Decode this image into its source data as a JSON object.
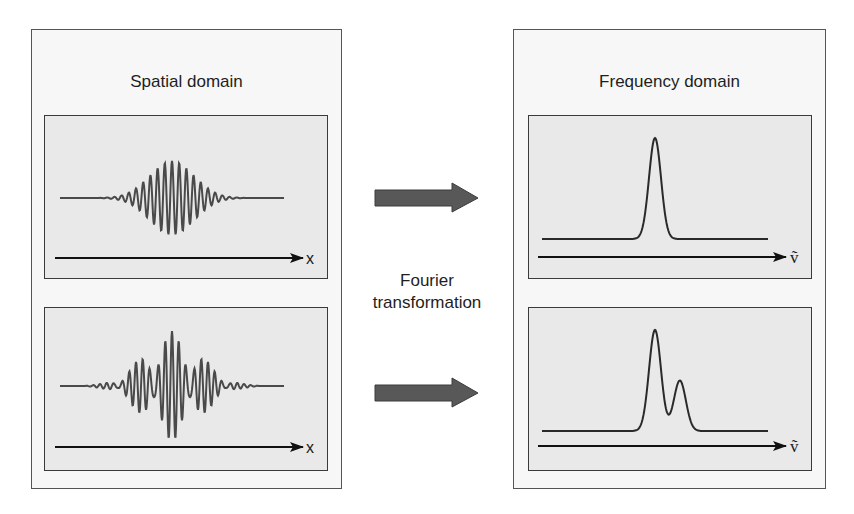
{
  "colors": {
    "panel_border": "#555555",
    "panel_bg": "#f7f7f7",
    "plot_bg": "#e9e9e9",
    "plot_border": "#3a3a3a",
    "waveform": "#4a4a4a",
    "spectrum": "#2a2a2a",
    "axis": "#111111",
    "arrow_fill": "#585858",
    "arrow_stroke": "#3c3c3c"
  },
  "left_panel": {
    "title": "Spatial domain",
    "plots": [
      {
        "name": "single-frequency-interferogram",
        "axis_label": "x",
        "description": "Gaussian-enveloped cosine burst (single frequency)"
      },
      {
        "name": "two-frequency-interferogram",
        "axis_label": "x",
        "description": "Beat pattern from two frequency components"
      }
    ]
  },
  "right_panel": {
    "title": "Frequency domain",
    "plots": [
      {
        "name": "single-peak-spectrum",
        "axis_label": "ṽ",
        "description": "Single narrow Gaussian peak"
      },
      {
        "name": "double-peak-spectrum",
        "axis_label": "ṽ",
        "description": "Large peak with smaller adjacent peak"
      }
    ]
  },
  "center": {
    "label_line1": "Fourier",
    "label_line2": "transformation",
    "arrow_icon": "right-block-arrow"
  },
  "chart_data": [
    {
      "type": "line",
      "title": "Spatial domain – top",
      "xlabel": "x",
      "ylabel": "",
      "signal": "cos(k·x)·exp(-x²/2σ²)",
      "components": [
        {
          "wavenumber_rel": 1.0,
          "amplitude": 1.0
        }
      ],
      "envelope_sigma_px": 22,
      "period_px": 7.2,
      "peak_amplitude_px": 37
    },
    {
      "type": "line",
      "title": "Spatial domain – bottom",
      "xlabel": "x",
      "ylabel": "",
      "signal": "sum of two cosines with Gaussian envelope (beat pattern)",
      "components": [
        {
          "wavenumber_rel": 1.0,
          "amplitude": 1.0
        },
        {
          "wavenumber_rel": 1.2,
          "amplitude": 0.6
        }
      ],
      "envelope_sigma_px": 28,
      "period_px": 7.2,
      "peak_amplitude_px": 55
    },
    {
      "type": "line",
      "title": "Frequency domain – top",
      "xlabel": "ṽ",
      "ylabel": "",
      "peaks": [
        {
          "position_rel": 0.5,
          "height_rel": 1.0,
          "width_px": 6
        }
      ]
    },
    {
      "type": "line",
      "title": "Frequency domain – bottom",
      "xlabel": "ṽ",
      "ylabel": "",
      "peaks": [
        {
          "position_rel": 0.5,
          "height_rel": 1.0,
          "width_px": 6
        },
        {
          "position_rel": 0.61,
          "height_rel": 0.5,
          "width_px": 6
        }
      ]
    }
  ]
}
